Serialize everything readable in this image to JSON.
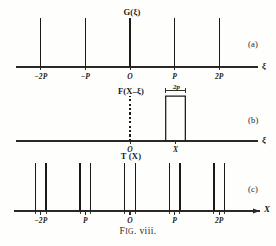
{
  "figure": {
    "caption_prefix": "F",
    "caption_smallcaps": "IG",
    "caption_rest": ". viii."
  },
  "panels": [
    {
      "id": "a",
      "marker": "(a)",
      "function_label": "G(ξ)",
      "axis_label": "ξ",
      "tick_labels": [
        "−2P",
        "−P",
        "O",
        "P",
        "2P"
      ]
    },
    {
      "id": "b",
      "marker": "(b)",
      "function_label": "F(X–ξ)",
      "axis_label": "ξ",
      "tick_labels": [
        "O",
        "X"
      ],
      "pulse_width_label": "2p"
    },
    {
      "id": "c",
      "marker": "(c)",
      "function_label": "T (X)",
      "axis_label": "X",
      "tick_labels": [
        "−2P",
        "P",
        "O",
        "P",
        "2P"
      ]
    }
  ],
  "chart_data": {
    "type": "line",
    "title": "FIG. viii.",
    "subplots": [
      {
        "id": "a",
        "type": "impulse",
        "title": "G(ξ)",
        "xlabel": "ξ",
        "ylabel": "",
        "xlim": [
          -2.6,
          2.6
        ],
        "ylim": [
          0,
          1.15
        ],
        "grid": false,
        "xticks": [
          -2,
          -1,
          0,
          1,
          2
        ],
        "xticklabels": [
          "−2P",
          "−P",
          "O",
          "P",
          "2P"
        ],
        "x": [
          -2,
          -1,
          0,
          1,
          2
        ],
        "values": [
          1,
          1,
          1,
          1,
          1
        ]
      },
      {
        "id": "b",
        "type": "area",
        "title": "F(X–ξ)",
        "xlabel": "ξ",
        "ylabel": "",
        "xlim": [
          -2.6,
          2.6
        ],
        "ylim": [
          0,
          1.15
        ],
        "grid": false,
        "xticks": [
          0,
          1.02
        ],
        "xticklabels": [
          "O",
          "X"
        ],
        "pulse_center": 1.02,
        "pulse_halfwidth": 0.22,
        "pulse_height": 1.0,
        "pulse_width_annotation": "2p",
        "dashed_marker_x": 0,
        "dashed_marker_height": 1.0
      },
      {
        "id": "c",
        "type": "impulse",
        "title": "T (X)",
        "xlabel": "X",
        "ylabel": "",
        "xlim": [
          -2.6,
          2.6
        ],
        "ylim": [
          0,
          1.15
        ],
        "grid": false,
        "xticks": [
          -2,
          -1,
          0,
          1,
          2
        ],
        "xticklabels": [
          "−2P",
          "P",
          "O",
          "P",
          "2P"
        ],
        "x": [
          -2.12,
          -1.88,
          -1.12,
          -0.88,
          -0.12,
          0.12,
          0.88,
          1.12,
          1.88,
          2.12
        ],
        "values": [
          1,
          1,
          1,
          1,
          1,
          1,
          1,
          1,
          1,
          1
        ]
      }
    ]
  },
  "colors": {
    "ink": "#1a1a18",
    "paper": "#fefefc",
    "axis": "#2a2924"
  }
}
